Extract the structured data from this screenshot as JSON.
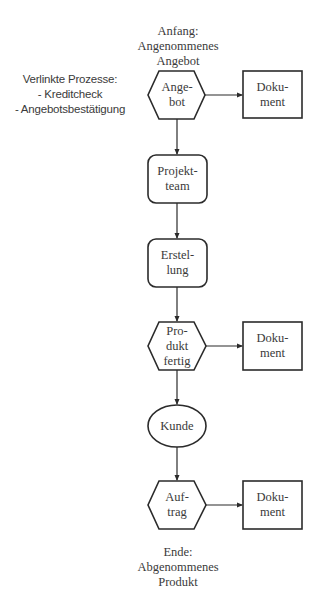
{
  "diagram": {
    "start_label": "Anfang:\nAngenommenes\nAngebot",
    "end_label": "Ende:\nAbgenommenes\nProdukt",
    "linked_processes": {
      "title": "Verlinkte Prozesse:",
      "items": [
        "- Kreditcheck",
        "- Angebotsbestätigung"
      ],
      "text": "Verlinkte Prozesse:\n- Kreditcheck\n- Angebotsbestätigung"
    },
    "nodes": [
      {
        "id": "angebot",
        "shape": "hexagon",
        "label": "Ange-\nbot"
      },
      {
        "id": "projektteam",
        "shape": "rounded-rect",
        "label": "Projekt-\nteam"
      },
      {
        "id": "erstellung",
        "shape": "rounded-rect",
        "label": "Erstel-\nlung"
      },
      {
        "id": "produkt-fertig",
        "shape": "hexagon",
        "label": "Pro-\ndukt\nfertig"
      },
      {
        "id": "kunde",
        "shape": "ellipse",
        "label": "Kunde"
      },
      {
        "id": "auftrag",
        "shape": "hexagon",
        "label": "Auf-\ntrag"
      }
    ],
    "documents": [
      {
        "attached_to": "angebot",
        "shape": "rect",
        "label": "Doku-\nment"
      },
      {
        "attached_to": "produkt-fertig",
        "shape": "rect",
        "label": "Doku-\nment"
      },
      {
        "attached_to": "auftrag",
        "shape": "rect",
        "label": "Doku-\nment"
      }
    ],
    "edges": [
      {
        "from": "angebot",
        "to": "projektteam"
      },
      {
        "from": "projektteam",
        "to": "erstellung"
      },
      {
        "from": "erstellung",
        "to": "produkt-fertig"
      },
      {
        "from": "produkt-fertig",
        "to": "kunde"
      },
      {
        "from": "kunde",
        "to": "auftrag"
      },
      {
        "from": "angebot",
        "to": "dokument-1"
      },
      {
        "from": "produkt-fertig",
        "to": "dokument-2"
      },
      {
        "from": "auftrag",
        "to": "dokument-3"
      }
    ],
    "colors": {
      "stroke": "#2b2b2b",
      "text": "#3a3a3a",
      "background": "#ffffff"
    }
  }
}
